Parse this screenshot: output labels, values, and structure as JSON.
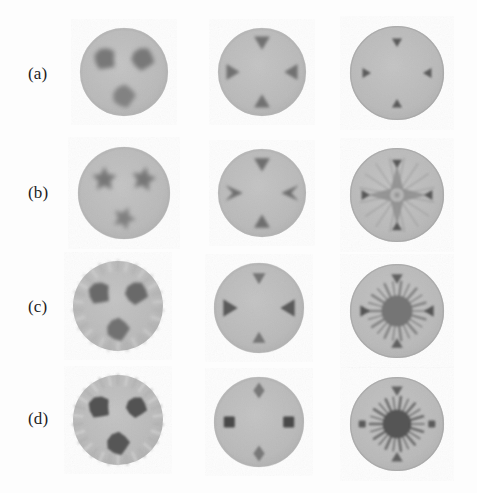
{
  "figure": {
    "type": "image-grid",
    "background_color": "#fdfdfd",
    "rows": 4,
    "columns": 3,
    "row_labels": [
      {
        "id": "row-a",
        "label": "(a)"
      },
      {
        "id": "row-b",
        "label": "(b)"
      },
      {
        "id": "row-c",
        "label": "(c)"
      },
      {
        "id": "row-d",
        "label": "(d)"
      }
    ],
    "colors": {
      "phantom_body": "#b9b9b9",
      "phantom_body_light": "#c3c3c3",
      "inclusion_dark": "#6e6e6e",
      "inclusion_darker": "#4f4f4f",
      "inclusion_darkest": "#3c3c3c",
      "highlight_light": "#d8d8d8",
      "background": "#fdfdfd",
      "label_text": "#1d1d1d"
    },
    "panels": [
      {
        "id": "panel-a1",
        "row": "(a)",
        "column": 1,
        "cx": 124,
        "cy": 72,
        "r": 44,
        "style": "blobs",
        "feature_count": 3,
        "blur": 2.1,
        "contrast": 0.42,
        "rim": "soft",
        "features": [
          {
            "shape": "blob",
            "angle": 215,
            "dist": 0.52,
            "size": 12,
            "darkness": 0.45
          },
          {
            "shape": "blob",
            "angle": 325,
            "dist": 0.52,
            "size": 12,
            "darkness": 0.45
          },
          {
            "shape": "blob",
            "angle": 90,
            "dist": 0.55,
            "size": 12,
            "darkness": 0.38
          }
        ]
      },
      {
        "id": "panel-a2",
        "row": "(a)",
        "column": 2,
        "cx": 262,
        "cy": 72,
        "r": 44,
        "style": "triangles",
        "feature_count": 4,
        "blur": 1.5,
        "contrast": 0.5,
        "rim": "soft",
        "features": [
          {
            "shape": "triangle",
            "angle": 270,
            "dist": 0.72,
            "size": 11,
            "darkness": 0.5
          },
          {
            "shape": "triangle",
            "angle": 90,
            "dist": 0.72,
            "size": 11,
            "darkness": 0.5
          },
          {
            "shape": "triangle",
            "angle": 180,
            "dist": 0.72,
            "size": 11,
            "darkness": 0.5
          },
          {
            "shape": "triangle",
            "angle": 0,
            "dist": 0.72,
            "size": 11,
            "darkness": 0.5
          }
        ]
      },
      {
        "id": "panel-a3",
        "row": "(a)",
        "column": 3,
        "cx": 397,
        "cy": 73,
        "r": 47,
        "style": "small-triangles",
        "feature_count": 4,
        "blur": 1.0,
        "contrast": 0.62,
        "rim": "hard",
        "features": [
          {
            "shape": "triangle",
            "angle": 270,
            "dist": 0.68,
            "size": 7,
            "darkness": 0.66
          },
          {
            "shape": "triangle",
            "angle": 90,
            "dist": 0.68,
            "size": 7,
            "darkness": 0.66
          },
          {
            "shape": "triangle",
            "angle": 180,
            "dist": 0.68,
            "size": 7,
            "darkness": 0.66
          },
          {
            "shape": "triangle",
            "angle": 0,
            "dist": 0.68,
            "size": 7,
            "darkness": 0.66
          }
        ]
      },
      {
        "id": "panel-b1",
        "row": "(b)",
        "column": 1,
        "cx": 124,
        "cy": 193,
        "r": 46,
        "style": "star-blobs",
        "feature_count": 3,
        "blur": 2.0,
        "contrast": 0.46,
        "rim": "soft",
        "features": [
          {
            "shape": "star-blob",
            "angle": 215,
            "dist": 0.52,
            "size": 14,
            "darkness": 0.46
          },
          {
            "shape": "star-blob",
            "angle": 325,
            "dist": 0.52,
            "size": 14,
            "darkness": 0.46
          },
          {
            "shape": "star-blob",
            "angle": 90,
            "dist": 0.55,
            "size": 13,
            "darkness": 0.4
          }
        ]
      },
      {
        "id": "panel-b2",
        "row": "(b)",
        "column": 2,
        "cx": 262,
        "cy": 193,
        "r": 44,
        "style": "arrow-triangles",
        "feature_count": 4,
        "blur": 1.5,
        "contrast": 0.52,
        "rim": "soft",
        "features": [
          {
            "shape": "triangle",
            "angle": 270,
            "dist": 0.7,
            "size": 11,
            "darkness": 0.52
          },
          {
            "shape": "triangle",
            "angle": 90,
            "dist": 0.7,
            "size": 11,
            "darkness": 0.52
          },
          {
            "shape": "chevron",
            "angle": 180,
            "dist": 0.7,
            "size": 13,
            "darkness": 0.52
          },
          {
            "shape": "chevron",
            "angle": 0,
            "dist": 0.7,
            "size": 13,
            "darkness": 0.52
          }
        ]
      },
      {
        "id": "panel-b3",
        "row": "(b)",
        "column": 3,
        "cx": 397,
        "cy": 195,
        "r": 47,
        "style": "center-starburst-light",
        "feature_count": 5,
        "blur": 1.1,
        "contrast": 0.6,
        "rim": "hard",
        "center_artifact": {
          "shape": "4-point-star",
          "radius": 30,
          "darkness": 0.3
        },
        "features": [
          {
            "shape": "triangle",
            "angle": 270,
            "dist": 0.7,
            "size": 7,
            "darkness": 0.68
          },
          {
            "shape": "triangle",
            "angle": 90,
            "dist": 0.7,
            "size": 7,
            "darkness": 0.68
          },
          {
            "shape": "triangle",
            "angle": 180,
            "dist": 0.7,
            "size": 7,
            "darkness": 0.68
          },
          {
            "shape": "triangle",
            "angle": 0,
            "dist": 0.7,
            "size": 7,
            "darkness": 0.68
          }
        ]
      },
      {
        "id": "panel-c1",
        "row": "(c)",
        "column": 1,
        "cx": 118,
        "cy": 306,
        "r": 45,
        "style": "blobs-with-rim-spikes",
        "feature_count": 3,
        "blur": 1.6,
        "contrast": 0.55,
        "rim": "spiky",
        "features": [
          {
            "shape": "blob",
            "angle": 215,
            "dist": 0.5,
            "size": 12,
            "darkness": 0.56
          },
          {
            "shape": "blob",
            "angle": 325,
            "dist": 0.5,
            "size": 12,
            "darkness": 0.56
          },
          {
            "shape": "blob",
            "angle": 90,
            "dist": 0.52,
            "size": 12,
            "darkness": 0.5
          }
        ]
      },
      {
        "id": "panel-c2",
        "row": "(c)",
        "column": 2,
        "cx": 259,
        "cy": 308,
        "r": 45,
        "style": "triangles-sharp",
        "feature_count": 4,
        "blur": 1.1,
        "contrast": 0.62,
        "rim": "soft",
        "features": [
          {
            "shape": "triangle",
            "angle": 270,
            "dist": 0.7,
            "size": 9,
            "darkness": 0.48
          },
          {
            "shape": "triangle",
            "angle": 90,
            "dist": 0.7,
            "size": 9,
            "darkness": 0.48
          },
          {
            "shape": "triangle",
            "angle": 180,
            "dist": 0.7,
            "size": 12,
            "darkness": 0.66
          },
          {
            "shape": "triangle",
            "angle": 0,
            "dist": 0.7,
            "size": 12,
            "darkness": 0.66
          }
        ]
      },
      {
        "id": "panel-c3",
        "row": "(c)",
        "column": 3,
        "cx": 397,
        "cy": 311,
        "r": 47,
        "style": "center-starburst-mid",
        "feature_count": 5,
        "blur": 1.0,
        "contrast": 0.68,
        "rim": "hard",
        "center_artifact": {
          "shape": "starburst",
          "radius": 25,
          "darkness": 0.48
        },
        "features": [
          {
            "shape": "triangle",
            "angle": 270,
            "dist": 0.72,
            "size": 8,
            "darkness": 0.62
          },
          {
            "shape": "triangle",
            "angle": 90,
            "dist": 0.72,
            "size": 8,
            "darkness": 0.62
          },
          {
            "shape": "triangle",
            "angle": 180,
            "dist": 0.72,
            "size": 8,
            "darkness": 0.7
          },
          {
            "shape": "triangle",
            "angle": 0,
            "dist": 0.72,
            "size": 8,
            "darkness": 0.7
          }
        ]
      },
      {
        "id": "panel-d1",
        "row": "(d)",
        "column": 1,
        "cx": 118,
        "cy": 420,
        "r": 45,
        "style": "blobs-sharp",
        "feature_count": 3,
        "blur": 1.1,
        "contrast": 0.72,
        "rim": "spiky",
        "features": [
          {
            "shape": "blob",
            "angle": 215,
            "dist": 0.5,
            "size": 12,
            "darkness": 0.72
          },
          {
            "shape": "blob",
            "angle": 325,
            "dist": 0.5,
            "size": 11,
            "darkness": 0.72
          },
          {
            "shape": "blob",
            "angle": 90,
            "dist": 0.52,
            "size": 12,
            "darkness": 0.68
          }
        ]
      },
      {
        "id": "panel-d2",
        "row": "(d)",
        "column": 2,
        "cx": 259,
        "cy": 422,
        "r": 45,
        "style": "squares",
        "feature_count": 4,
        "blur": 0.8,
        "contrast": 0.75,
        "rim": "soft",
        "features": [
          {
            "shape": "diamond",
            "angle": 270,
            "dist": 0.7,
            "size": 8,
            "darkness": 0.45
          },
          {
            "shape": "diamond",
            "angle": 90,
            "dist": 0.7,
            "size": 8,
            "darkness": 0.45
          },
          {
            "shape": "square",
            "angle": 180,
            "dist": 0.66,
            "size": 11,
            "darkness": 0.78
          },
          {
            "shape": "square",
            "angle": 0,
            "dist": 0.66,
            "size": 11,
            "darkness": 0.78
          }
        ]
      },
      {
        "id": "panel-d3",
        "row": "(d)",
        "column": 3,
        "cx": 397,
        "cy": 424,
        "r": 47,
        "style": "center-starburst-dark",
        "feature_count": 5,
        "blur": 0.9,
        "contrast": 0.8,
        "rim": "hard",
        "center_artifact": {
          "shape": "starburst",
          "radius": 23,
          "darkness": 0.7
        },
        "features": [
          {
            "shape": "triangle",
            "angle": 270,
            "dist": 0.74,
            "size": 8,
            "darkness": 0.62
          },
          {
            "shape": "triangle",
            "angle": 90,
            "dist": 0.74,
            "size": 8,
            "darkness": 0.62
          },
          {
            "shape": "square",
            "angle": 180,
            "dist": 0.74,
            "size": 7,
            "darkness": 0.66
          },
          {
            "shape": "square",
            "angle": 0,
            "dist": 0.74,
            "size": 7,
            "darkness": 0.66
          }
        ]
      }
    ]
  }
}
